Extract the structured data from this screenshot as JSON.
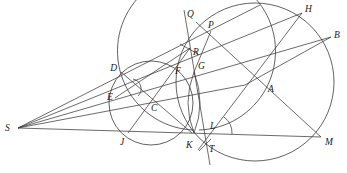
{
  "figure": {
    "type": "geometry-construction",
    "stroke_color": "#3a3a3a",
    "label_color": "#1a1a1a",
    "points": {
      "S": {
        "label": "S",
        "x": 18,
        "y": 128,
        "lx": 5,
        "ly": 131
      },
      "D": {
        "label": "D",
        "x": 121,
        "y": 72,
        "lx": 117,
        "ly": 71
      },
      "E": {
        "label": "E",
        "x": 115,
        "y": 98,
        "lx": 107,
        "ly": 100
      },
      "C": {
        "label": "C",
        "x": 147,
        "y": 103,
        "lx": 151,
        "ly": 111
      },
      "J": {
        "label": "J",
        "x": 128,
        "y": 133,
        "lx": 120,
        "ly": 145
      },
      "K": {
        "label": "K",
        "x": 192,
        "y": 133,
        "lx": 186,
        "ly": 148
      },
      "F": {
        "label": "F",
        "x": 180,
        "y": 63,
        "lx": 175,
        "ly": 74
      },
      "G": {
        "label": "G",
        "x": 194,
        "y": 72,
        "lx": 198,
        "ly": 69
      },
      "R": {
        "label": "R",
        "x": 190,
        "y": 48,
        "lx": 193,
        "ly": 55
      },
      "Q": {
        "label": "Q",
        "x": 186,
        "y": 16,
        "lx": 187,
        "ly": 17
      },
      "P": {
        "label": "P",
        "x": 211,
        "y": 31,
        "lx": 208,
        "ly": 28
      },
      "H": {
        "label": "H",
        "x": 302,
        "y": 13,
        "lx": 305,
        "ly": 12
      },
      "B": {
        "label": "B",
        "x": 331,
        "y": 37,
        "lx": 334,
        "ly": 38
      },
      "A": {
        "label": "A",
        "x": 245,
        "y": 85,
        "lx": 268,
        "ly": 92
      },
      "L": {
        "label": "L",
        "x": 211,
        "y": 134,
        "lx": 210,
        "ly": 129
      },
      "T": {
        "label": "T",
        "x": 205,
        "y": 144,
        "lx": 209,
        "ly": 152
      },
      "M": {
        "label": "M",
        "x": 321,
        "y": 137,
        "lx": 325,
        "ly": 145
      },
      "X": {
        "x": 246,
        "y": 87
      }
    },
    "circles": [
      {
        "name": "small-circle",
        "cx": 151,
        "cy": 103,
        "r": 42
      },
      {
        "name": "large-circle",
        "cx": 255,
        "cy": 82,
        "r": 79
      }
    ],
    "segments": [
      [
        "S",
        "D2"
      ],
      [
        "S",
        "H"
      ],
      [
        "S",
        "B2"
      ],
      [
        "S",
        "M"
      ],
      [
        "S",
        "F2"
      ]
    ],
    "angle_mark": {
      "cx": 213,
      "cy": 133,
      "r": 20,
      "start_deg": -55,
      "end_deg": 0
    }
  }
}
